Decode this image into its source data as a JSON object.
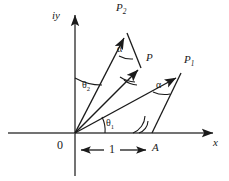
{
  "figure": {
    "type": "vector-diagram",
    "background_color": "#ffffff",
    "line_color": "#1a1a1a",
    "axes": {
      "x_label": "x",
      "y_label": "iy",
      "origin_label": "0",
      "origin_px": [
        75,
        133
      ],
      "x_axis_from_px": [
        8,
        133
      ],
      "x_axis_to_px": [
        218,
        133
      ],
      "y_axis_from_px": [
        75,
        176
      ],
      "y_axis_to_px": [
        75,
        10
      ]
    },
    "vectors": [
      {
        "name": "P2",
        "label": "P",
        "subscript": "2",
        "from_px": [
          75,
          133
        ],
        "to_px": [
          126,
          33
        ],
        "label_px": [
          118,
          4
        ]
      },
      {
        "name": "P",
        "label": "P",
        "subscript": "",
        "from_px": [
          75,
          133
        ],
        "to_px": [
          141,
          66
        ],
        "label_px": [
          146,
          56
        ]
      },
      {
        "name": "P1",
        "label": "P",
        "subscript": "1",
        "from_px": [
          75,
          133
        ],
        "to_px": [
          180,
          74
        ],
        "label_px": [
          186,
          57
        ]
      }
    ],
    "connector_lines": [
      {
        "name": "P-to-P2",
        "from_px": [
          141,
          66
        ],
        "to_px": [
          126,
          33
        ]
      },
      {
        "name": "A-to-P1",
        "from_px": [
          152,
          133
        ],
        "to_px": [
          180,
          74
        ]
      }
    ],
    "angles": [
      {
        "name": "theta2",
        "label": "θ",
        "subscript": "2",
        "label_px": [
          84,
          83
        ],
        "vertex": "origin",
        "between": "y-axis and P2"
      },
      {
        "name": "theta1",
        "label": "θ",
        "subscript": "1",
        "label_px": [
          108,
          121
        ],
        "vertex": "origin",
        "between": "x-axis and P"
      },
      {
        "name": "alpha-top",
        "label": "α",
        "subscript": "",
        "label_px": [
          119,
          48
        ],
        "vertex": "P2 tip",
        "between": "P2 and P-to-P2"
      },
      {
        "name": "alpha-right",
        "label": "α",
        "subscript": "",
        "label_px": [
          158,
          84
        ],
        "vertex": "P1 tip",
        "between": "P1 and A-to-P1"
      }
    ],
    "measurement": {
      "name": "unit-length",
      "label": "1",
      "label_px": [
        113,
        144
      ],
      "from_px": [
        79,
        150
      ],
      "to_px": [
        148,
        150
      ],
      "endpoint_label": "A",
      "endpoint_label_px": [
        155,
        143
      ]
    }
  }
}
